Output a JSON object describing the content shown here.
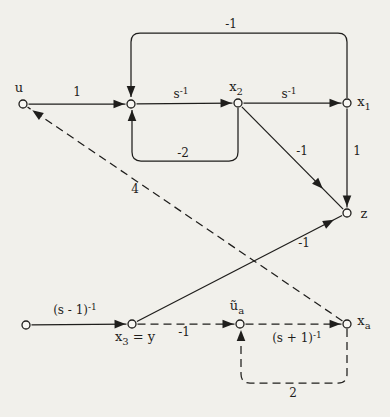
{
  "diagram": {
    "kind": "signal-flow-graph",
    "background": "#f1f0eb",
    "ink": "#1f1e1c",
    "node_fill": "#f8f7f3",
    "nodes": [
      {
        "id": "u",
        "x": 23,
        "y": 104,
        "label": [
          {
            "t": "u"
          }
        ],
        "lx": 19,
        "ly": 88
      },
      {
        "id": "n1",
        "x": 131,
        "y": 104
      },
      {
        "id": "x2",
        "x": 238,
        "y": 103,
        "label": [
          {
            "t": "x"
          },
          {
            "t": "2",
            "sub": true
          }
        ],
        "lx": 236,
        "ly": 87
      },
      {
        "id": "x1",
        "x": 347,
        "y": 103,
        "label": [
          {
            "t": "x"
          },
          {
            "t": "1",
            "sub": true
          }
        ],
        "lx": 364,
        "ly": 102
      },
      {
        "id": "z",
        "x": 347,
        "y": 213,
        "label": [
          {
            "t": "z"
          }
        ],
        "lx": 364,
        "ly": 214
      },
      {
        "id": "b",
        "x": 26,
        "y": 325
      },
      {
        "id": "x3y",
        "x": 132,
        "y": 324,
        "label": [
          {
            "t": "x"
          },
          {
            "t": "3",
            "sub": true
          },
          {
            "t": " = y"
          }
        ],
        "lx": 135,
        "ly": 337
      },
      {
        "id": "ua",
        "x": 240,
        "y": 324,
        "label": [
          {
            "t": "ũ"
          },
          {
            "t": "a",
            "sub": true
          }
        ],
        "lx": 237,
        "ly": 306
      },
      {
        "id": "xa",
        "x": 347,
        "y": 324,
        "label": [
          {
            "t": "x"
          },
          {
            "t": "a",
            "sub": true
          }
        ],
        "lx": 364,
        "ly": 321
      }
    ],
    "edges": [
      {
        "id": "u-n1",
        "from": "u",
        "to": "n1",
        "dash": false,
        "gain": [
          {
            "t": "1"
          }
        ],
        "gx": 77,
        "gy": 92
      },
      {
        "id": "n1-x2",
        "from": "n1",
        "to": "x2",
        "dash": false,
        "gain": [
          {
            "t": "s"
          },
          {
            "t": "-1",
            "sup": true
          }
        ],
        "gx": 181,
        "gy": 94
      },
      {
        "id": "x2-x1",
        "from": "x2",
        "to": "x1",
        "dash": false,
        "gain": [
          {
            "t": "s"
          },
          {
            "t": "-1",
            "sup": true
          }
        ],
        "gx": 289,
        "gy": 94
      },
      {
        "id": "x1-n1-top",
        "dash": false,
        "points": [
          [
            347,
            98
          ],
          [
            347,
            33
          ],
          [
            131,
            33
          ],
          [
            131,
            97
          ]
        ],
        "arrow": {
          "x": 131,
          "y": 97,
          "angle": 90
        },
        "gain": [
          {
            "t": "-1"
          }
        ],
        "gx": 231,
        "gy": 24
      },
      {
        "id": "x2-n1-bottom",
        "dash": false,
        "points": [
          [
            238,
            108
          ],
          [
            238,
            161
          ],
          [
            132,
            161
          ],
          [
            132,
            110
          ]
        ],
        "arrow": {
          "x": 132,
          "y": 110,
          "angle": -90
        },
        "gain": [
          {
            "t": "-2"
          }
        ],
        "gx": 183,
        "gy": 153
      },
      {
        "id": "x2-z",
        "from": "x2",
        "to": "z",
        "dash": false,
        "arrow_t": 0.8,
        "gain": [
          {
            "t": "-1"
          }
        ],
        "gx": 302,
        "gy": 151
      },
      {
        "id": "x1-z",
        "from": "x1",
        "to": "z",
        "dash": false,
        "gain": [
          {
            "t": "1"
          }
        ],
        "gx": 357,
        "gy": 151
      },
      {
        "id": "x3y-z",
        "from": "x3y",
        "to": "z",
        "dash": false,
        "arrow_t": 0.96,
        "gain": [
          {
            "t": "-1"
          }
        ],
        "gx": 304,
        "gy": 243
      },
      {
        "id": "xa-u",
        "from": "xa",
        "to": "u",
        "dash": true,
        "arrow_t": 0.985,
        "gain": [
          {
            "t": "4"
          }
        ],
        "gx": 135,
        "gy": 189
      },
      {
        "id": "b-x3y",
        "from": "b",
        "to": "x3y",
        "dash": false,
        "gain": [
          {
            "t": "(s - 1)"
          },
          {
            "t": "-1",
            "sup": true
          }
        ],
        "gx": 75,
        "gy": 310
      },
      {
        "id": "x3y-ua",
        "from": "x3y",
        "to": "ua",
        "dash": true,
        "gain": [
          {
            "t": "-1"
          }
        ],
        "gx": 184,
        "gy": 332
      },
      {
        "id": "ua-xa",
        "from": "ua",
        "to": "xa",
        "dash": true,
        "gain": [
          {
            "t": "(s + 1)"
          },
          {
            "t": "-1",
            "sup": true
          }
        ],
        "gx": 297,
        "gy": 338
      },
      {
        "id": "xa-ua-bottom",
        "dash": true,
        "points": [
          [
            347,
            329
          ],
          [
            347,
            383
          ],
          [
            241,
            383
          ],
          [
            241,
            330
          ]
        ],
        "arrow": {
          "x": 241,
          "y": 330,
          "angle": -90
        },
        "gain": [
          {
            "t": "2"
          }
        ],
        "gx": 293,
        "gy": 393
      }
    ],
    "style": {
      "node_radius": 4,
      "line_width": 1.25,
      "dash_pattern": "8 5",
      "arrow_length": 11,
      "arrow_half_width": 4.3,
      "gain_font_size": 12,
      "node_font_size": 13
    }
  }
}
